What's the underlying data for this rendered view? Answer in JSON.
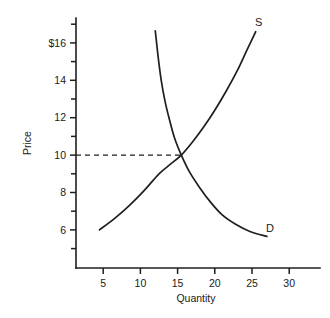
{
  "chart_data": {
    "type": "line",
    "title": "",
    "subtitle": "",
    "xlabel": "Quantity",
    "ylabel": "Price",
    "xlim": [
      0,
      32.8
    ],
    "ylim": [
      4.0,
      17.4
    ],
    "grid": false,
    "legend_position": "inline-curve-end-labels",
    "x_ticks_major": [
      5,
      10,
      15,
      20,
      25,
      30
    ],
    "x_tick_labels": [
      "5",
      "10",
      "15",
      "20",
      "25",
      "30"
    ],
    "y_ticks_major": [
      6,
      8,
      10,
      12,
      14,
      16
    ],
    "y_tick_labels": [
      "6",
      "8",
      "10",
      "12",
      "14",
      "$16"
    ],
    "y_ticks_minor": [
      5,
      7,
      9,
      11,
      13,
      15,
      17
    ],
    "series": [
      {
        "name": "Supply",
        "label": "S",
        "label_x": 25.9,
        "label_y": 16.9,
        "points": [
          [
            4.5,
            6.0
          ],
          [
            6.5,
            6.6
          ],
          [
            8.5,
            7.3
          ],
          [
            10.5,
            8.1
          ],
          [
            12.5,
            9.0
          ],
          [
            14.0,
            9.5
          ],
          [
            15.5,
            10.0
          ],
          [
            17.0,
            10.7
          ],
          [
            18.5,
            11.5
          ],
          [
            20.0,
            12.4
          ],
          [
            21.5,
            13.4
          ],
          [
            23.0,
            14.5
          ],
          [
            24.3,
            15.6
          ],
          [
            25.5,
            16.6
          ]
        ]
      },
      {
        "name": "Demand",
        "label": "D",
        "label_x": 27.4,
        "label_y": 5.9,
        "points": [
          [
            12.0,
            16.65
          ],
          [
            12.4,
            15.2
          ],
          [
            12.8,
            14.0
          ],
          [
            13.3,
            12.9
          ],
          [
            13.9,
            11.9
          ],
          [
            14.6,
            10.9
          ],
          [
            15.5,
            10.0
          ],
          [
            16.6,
            9.1
          ],
          [
            17.9,
            8.3
          ],
          [
            19.4,
            7.5
          ],
          [
            21.0,
            6.8
          ],
          [
            22.8,
            6.3
          ],
          [
            24.8,
            5.9
          ],
          [
            27.0,
            5.65
          ]
        ]
      }
    ],
    "annotations": [
      {
        "name": "equilibrium-price-line",
        "style": "dashed",
        "from": [
          0,
          10
        ],
        "to": [
          15.5,
          10
        ]
      }
    ],
    "equilibrium": {
      "quantity": 15.5,
      "price": 10
    }
  }
}
